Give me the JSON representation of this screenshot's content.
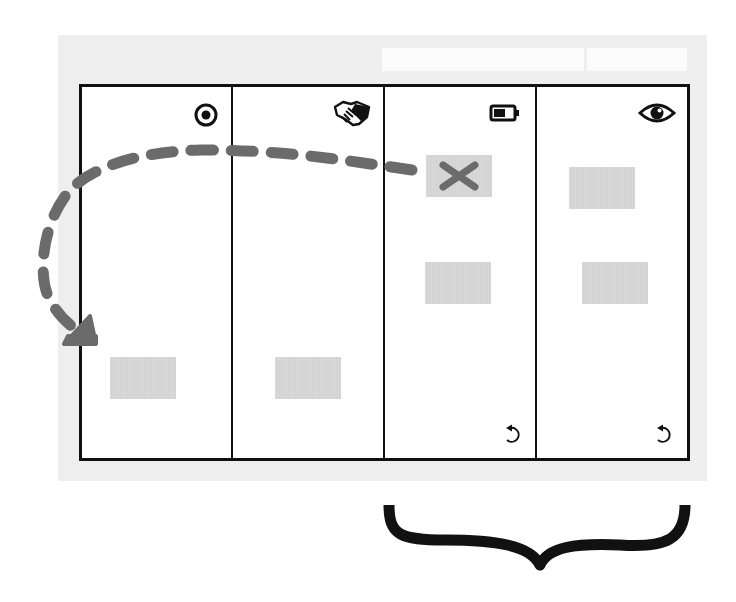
{
  "diagram": {
    "colors": {
      "panel": "#eeeeee",
      "board_border": "#111111",
      "card": "#d4d4d4",
      "arrow": "#6b6b6b",
      "brace": "#111111"
    },
    "columns": [
      {
        "id": "col-1",
        "icon": "target-icon",
        "cards": 1,
        "has_reset": false
      },
      {
        "id": "col-2",
        "icon": "handshake-icon",
        "cards": 1,
        "has_reset": false
      },
      {
        "id": "col-3",
        "icon": "battery-icon",
        "cards": 2,
        "has_reset": true,
        "removed_card": true
      },
      {
        "id": "col-4",
        "icon": "eye-icon",
        "cards": 2,
        "has_reset": true
      }
    ],
    "arrow": {
      "style": "dashed",
      "from": "col-3 removed card",
      "to": "col-1 card"
    },
    "brace": {
      "spans": [
        "col-3",
        "col-4"
      ],
      "orientation": "below"
    }
  }
}
